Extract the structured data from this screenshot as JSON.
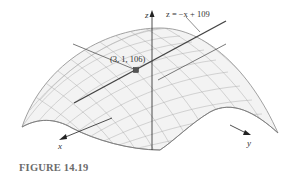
{
  "figure": {
    "caption": "FIGURE 14.19",
    "surface": "downward-opening paraboloid mesh",
    "tangent_line_label": "z = −x + 109",
    "point_label": "(3, 1, 106)",
    "axes": {
      "x": "x",
      "y": "y",
      "z": "z"
    },
    "colors": {
      "mesh": "#9a9a9a",
      "surface_fill": "#f2f2f2",
      "tangent_line": "#4a4a4a",
      "axis": "#222222",
      "point": "#555555",
      "caption": "#6b6b6b"
    }
  }
}
